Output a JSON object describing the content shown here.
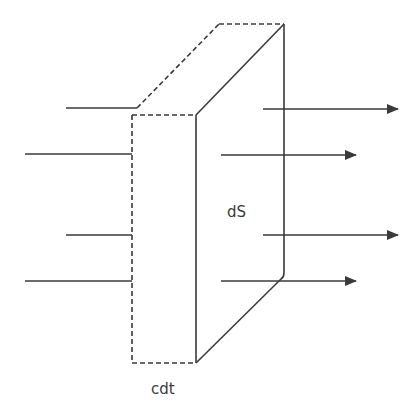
{
  "diagram": {
    "type": "flux-through-slab",
    "colors": {
      "stroke": "#3a3a3a",
      "background": "#ffffff"
    },
    "labels": {
      "surface": "dS",
      "thickness": "cdt"
    },
    "incoming_lines": [
      {
        "x1": 66,
        "x2": 137,
        "y": 108
      },
      {
        "x1": 25,
        "x2": 132,
        "y": 154
      },
      {
        "x1": 66,
        "x2": 132,
        "y": 235
      },
      {
        "x1": 25,
        "x2": 132,
        "y": 281
      }
    ],
    "outgoing_arrows": [
      {
        "x1": 263,
        "x2": 398,
        "y": 109
      },
      {
        "x1": 221,
        "x2": 356,
        "y": 155
      },
      {
        "x1": 263,
        "x2": 398,
        "y": 235
      },
      {
        "x1": 221,
        "x2": 356,
        "y": 281
      }
    ],
    "slab": {
      "front_left_x": 132,
      "front_right_x": 196,
      "front_top_y": 115,
      "front_bottom_y": 363,
      "back_left_x": 219,
      "back_right_x": 284,
      "back_top_y": 24,
      "back_bottom_y": 275
    }
  }
}
